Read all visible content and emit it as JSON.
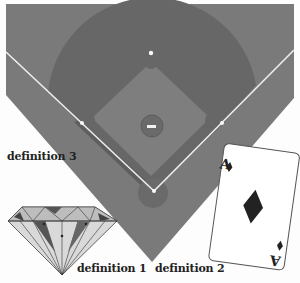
{
  "labels": {
    "definition_1": "definition 1",
    "definition_2": "definition 2",
    "definition_3": "definition 3"
  },
  "card": {
    "rank": "A",
    "suit": "diamond"
  },
  "colors": {
    "grass": "#7a7a7a",
    "dirt": "#676767",
    "infield": "#7e7e7e",
    "lines": "#f0f0f0",
    "card_face": "#ffffff",
    "suit": "#222222"
  },
  "icons": [
    "baseball-diamond-icon",
    "playing-card-icon",
    "gem-diamond-icon"
  ]
}
